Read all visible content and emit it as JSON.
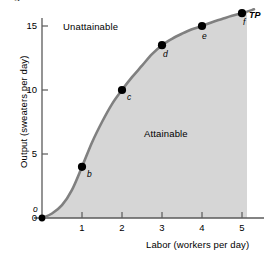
{
  "chart_data": {
    "type": "line",
    "title": "",
    "xlabel": "Labor (workers per day)",
    "ylabel": "Output (sweaters per day)",
    "xlim": [
      0,
      5.55
    ],
    "ylim": [
      0,
      16.9
    ],
    "grid": false,
    "legend_position": "none",
    "series": [
      {
        "name": "TP",
        "label": "TP",
        "color": "#808080",
        "points": [
          {
            "id": "o",
            "label": "o",
            "x": 0,
            "y": 0
          },
          {
            "id": "b",
            "label": "b",
            "x": 1,
            "y": 4
          },
          {
            "id": "c",
            "label": "c",
            "x": 2,
            "y": 10
          },
          {
            "id": "d",
            "label": "d",
            "x": 3,
            "y": 13.5
          },
          {
            "id": "e",
            "label": "e",
            "x": 4,
            "y": 15
          },
          {
            "id": "f",
            "label": "f",
            "x": 5,
            "y": 16
          }
        ],
        "curve": [
          {
            "x": 0,
            "y": 0
          },
          {
            "x": 0.25,
            "y": 0.35
          },
          {
            "x": 0.5,
            "y": 1.0
          },
          {
            "x": 0.75,
            "y": 2.2
          },
          {
            "x": 1,
            "y": 4.0
          },
          {
            "x": 1.25,
            "y": 5.9
          },
          {
            "x": 1.5,
            "y": 7.5
          },
          {
            "x": 1.75,
            "y": 8.9
          },
          {
            "x": 2,
            "y": 10.0
          },
          {
            "x": 2.25,
            "y": 11.0
          },
          {
            "x": 2.5,
            "y": 11.9
          },
          {
            "x": 2.75,
            "y": 12.8
          },
          {
            "x": 3,
            "y": 13.5
          },
          {
            "x": 3.25,
            "y": 14.0
          },
          {
            "x": 3.5,
            "y": 14.4
          },
          {
            "x": 3.75,
            "y": 14.75
          },
          {
            "x": 4,
            "y": 15.0
          },
          {
            "x": 4.25,
            "y": 15.3
          },
          {
            "x": 4.5,
            "y": 15.55
          },
          {
            "x": 4.75,
            "y": 15.8
          },
          {
            "x": 5,
            "y": 16.0
          },
          {
            "x": 5.3,
            "y": 16.3
          }
        ]
      }
    ],
    "xticks": [
      {
        "value": 1,
        "label": "1"
      },
      {
        "value": 2,
        "label": "2"
      },
      {
        "value": 3,
        "label": "3"
      },
      {
        "value": 4,
        "label": "4"
      },
      {
        "value": 5,
        "label": "5"
      }
    ],
    "yticks": [
      {
        "value": 0,
        "label": "0"
      },
      {
        "value": 5,
        "label": "5"
      },
      {
        "value": 10,
        "label": "10"
      },
      {
        "value": 15,
        "label": "15"
      }
    ],
    "annotations": [
      {
        "id": "unattainable",
        "text": "Unattainable"
      },
      {
        "id": "attainable",
        "text": "Attainable"
      }
    ],
    "shaded_region": {
      "label": "Attainable",
      "fill": "#d6d6d6",
      "x_max": 5.2
    },
    "colors": {
      "curve": "#808080",
      "axis": "#5a5a5a",
      "marker": "#000000",
      "shade": "#d6d6d6",
      "text": "#000000"
    }
  },
  "top_fragment": {
    "text": "g"
  }
}
